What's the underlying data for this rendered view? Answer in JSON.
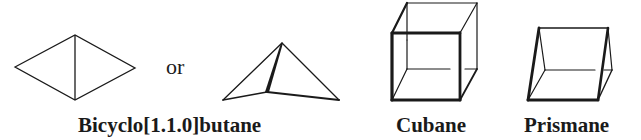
{
  "figure": {
    "molecules": [
      {
        "name": "Bicyclo[1.1.0]butane",
        "representations": [
          "planar diamond (2D)",
          "3D perspective"
        ]
      },
      {
        "name": "Cubane",
        "representations": [
          "3D cube"
        ]
      },
      {
        "name": "Prismane",
        "representations": [
          "3D triangular prism"
        ]
      }
    ],
    "connector_text": "or",
    "labels": {
      "bicyclobutane": "Bicyclo[1.1.0]butane",
      "cubane": "Cubane",
      "prismane": "Prismane"
    },
    "colors": {
      "stroke": "#1a1a1a",
      "background": "#ffffff"
    }
  }
}
